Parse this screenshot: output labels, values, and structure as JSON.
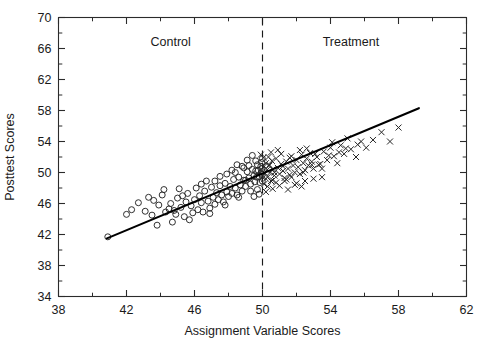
{
  "chart_data": {
    "type": "scatter",
    "title": "",
    "xlabel": "Assignment Variable Scores",
    "ylabel": "Posttest Scores",
    "xlim": [
      38,
      62
    ],
    "ylim": [
      34,
      70
    ],
    "xticks": [
      38,
      42,
      46,
      50,
      54,
      58,
      62
    ],
    "yticks": [
      34,
      38,
      42,
      46,
      50,
      54,
      58,
      62,
      66,
      70
    ],
    "xtick_labels": [
      "38",
      "42",
      "46",
      "50",
      "54",
      "58",
      "62"
    ],
    "ytick_labels": [
      "34",
      "38",
      "42",
      "46",
      "50",
      "54",
      "58",
      "62",
      "66",
      "70"
    ],
    "x_minor_step": 2,
    "y_minor_step": 2,
    "grid": false,
    "legend": "none",
    "annotations": [
      {
        "text": "Control",
        "x": 44.6,
        "y": 66.3
      },
      {
        "text": "Treatment",
        "x": 55.2,
        "y": 66.3
      }
    ],
    "cutoff": {
      "x": 50,
      "style": "dashed",
      "label": ""
    },
    "fit_line": {
      "x0": 40.85,
      "y0": 41.5,
      "x1": 59.2,
      "y1": 58.3,
      "slope": 0.9155,
      "intercept": 4.09
    },
    "series": [
      {
        "name": "Control",
        "marker": "circle",
        "marker_size": 4.0,
        "color": "#262626",
        "points": [
          [
            40.9,
            41.7
          ],
          [
            42.0,
            44.6
          ],
          [
            42.3,
            45.2
          ],
          [
            42.7,
            46.1
          ],
          [
            43.1,
            45.0
          ],
          [
            43.5,
            44.5
          ],
          [
            43.6,
            46.4
          ],
          [
            43.9,
            45.8
          ],
          [
            44.1,
            47.1
          ],
          [
            44.3,
            44.9
          ],
          [
            44.5,
            45.3
          ],
          [
            44.6,
            46.0
          ],
          [
            44.8,
            45.1
          ],
          [
            44.9,
            44.6
          ],
          [
            45.0,
            46.7
          ],
          [
            45.2,
            45.5
          ],
          [
            45.4,
            44.3
          ],
          [
            45.5,
            46.2
          ],
          [
            45.6,
            47.3
          ],
          [
            45.8,
            45.7
          ],
          [
            45.9,
            44.8
          ],
          [
            46.0,
            46.5
          ],
          [
            46.2,
            45.2
          ],
          [
            46.3,
            47.0
          ],
          [
            46.4,
            46.1
          ],
          [
            46.5,
            44.9
          ],
          [
            46.6,
            47.6
          ],
          [
            46.8,
            46.3
          ],
          [
            46.9,
            45.4
          ],
          [
            47.0,
            48.1
          ],
          [
            47.1,
            46.8
          ],
          [
            47.2,
            45.9
          ],
          [
            47.3,
            47.4
          ],
          [
            47.4,
            46.5
          ],
          [
            47.5,
            48.3
          ],
          [
            47.6,
            47.1
          ],
          [
            47.7,
            46.2
          ],
          [
            47.8,
            48.6
          ],
          [
            47.9,
            47.5
          ],
          [
            48.0,
            46.9
          ],
          [
            48.1,
            48.2
          ],
          [
            48.2,
            47.3
          ],
          [
            48.3,
            49.1
          ],
          [
            48.4,
            48.0
          ],
          [
            48.5,
            47.1
          ],
          [
            48.6,
            49.4
          ],
          [
            48.7,
            48.4
          ],
          [
            48.8,
            47.6
          ],
          [
            48.9,
            49.0
          ],
          [
            49.0,
            48.2
          ],
          [
            49.1,
            50.1
          ],
          [
            49.2,
            49.3
          ],
          [
            49.3,
            48.5
          ],
          [
            49.4,
            50.4
          ],
          [
            49.5,
            49.6
          ],
          [
            49.55,
            48.8
          ],
          [
            49.6,
            50.2
          ],
          [
            49.65,
            49.4
          ],
          [
            49.7,
            51.0
          ],
          [
            49.75,
            50.3
          ],
          [
            49.8,
            49.5
          ],
          [
            49.85,
            48.7
          ],
          [
            49.9,
            50.8
          ],
          [
            49.92,
            49.9
          ],
          [
            49.95,
            51.3
          ],
          [
            49.97,
            50.5
          ],
          [
            49.98,
            49.7
          ],
          [
            49.99,
            48.9
          ],
          [
            49.99,
            51.8
          ],
          [
            49.99,
            50.1
          ],
          [
            48.2,
            50.3
          ],
          [
            48.5,
            51.0
          ],
          [
            47.9,
            49.8
          ],
          [
            49.1,
            51.6
          ],
          [
            49.4,
            52.2
          ],
          [
            48.8,
            50.8
          ],
          [
            46.7,
            48.9
          ],
          [
            47.5,
            49.5
          ],
          [
            44.2,
            47.8
          ],
          [
            43.3,
            46.8
          ],
          [
            45.1,
            47.9
          ],
          [
            46.1,
            48.0
          ],
          [
            47.2,
            48.9
          ],
          [
            48.9,
            50.6
          ],
          [
            49.3,
            47.6
          ],
          [
            48.6,
            46.8
          ],
          [
            47.8,
            45.8
          ],
          [
            46.9,
            44.7
          ],
          [
            45.7,
            43.9
          ],
          [
            44.7,
            43.6
          ],
          [
            43.8,
            43.2
          ],
          [
            49.5,
            46.9
          ],
          [
            49.7,
            47.8
          ],
          [
            49.8,
            47.2
          ],
          [
            48.4,
            50.0
          ],
          [
            49.0,
            49.0
          ],
          [
            46.4,
            48.5
          ],
          [
            45.3,
            47.0
          ],
          [
            49.2,
            50.9
          ],
          [
            49.6,
            51.5
          ]
        ]
      },
      {
        "name": "Treatment",
        "marker": "cross",
        "marker_size": 4.2,
        "color": "#262626",
        "points": [
          [
            50.05,
            51.9
          ],
          [
            50.1,
            50.8
          ],
          [
            50.15,
            49.9
          ],
          [
            50.2,
            51.2
          ],
          [
            50.25,
            50.3
          ],
          [
            50.3,
            49.4
          ],
          [
            50.35,
            52.0
          ],
          [
            50.4,
            50.9
          ],
          [
            50.45,
            50.0
          ],
          [
            50.5,
            48.9
          ],
          [
            50.55,
            51.5
          ],
          [
            50.6,
            50.4
          ],
          [
            50.7,
            49.6
          ],
          [
            50.8,
            51.8
          ],
          [
            50.9,
            50.6
          ],
          [
            51.0,
            49.8
          ],
          [
            51.1,
            51.1
          ],
          [
            51.2,
            50.2
          ],
          [
            51.3,
            48.9
          ],
          [
            51.4,
            51.4
          ],
          [
            51.5,
            50.5
          ],
          [
            51.6,
            49.7
          ],
          [
            51.7,
            52.1
          ],
          [
            51.8,
            50.9
          ],
          [
            51.9,
            50.0
          ],
          [
            52.0,
            51.6
          ],
          [
            52.1,
            50.7
          ],
          [
            52.2,
            49.8
          ],
          [
            52.3,
            52.3
          ],
          [
            52.4,
            51.2
          ],
          [
            52.5,
            50.3
          ],
          [
            52.6,
            51.8
          ],
          [
            52.7,
            50.9
          ],
          [
            52.8,
            52.5
          ],
          [
            52.9,
            51.4
          ],
          [
            53.0,
            50.5
          ],
          [
            53.2,
            52.0
          ],
          [
            53.4,
            51.1
          ],
          [
            53.6,
            52.7
          ],
          [
            53.8,
            51.6
          ],
          [
            54.0,
            53.2
          ],
          [
            54.2,
            52.1
          ],
          [
            54.4,
            51.2
          ],
          [
            54.6,
            53.5
          ],
          [
            54.8,
            52.4
          ],
          [
            55.0,
            54.4
          ],
          [
            55.2,
            53.0
          ],
          [
            55.5,
            52.0
          ],
          [
            55.8,
            54.0
          ],
          [
            56.1,
            53.2
          ],
          [
            56.5,
            54.2
          ],
          [
            57.0,
            55.2
          ],
          [
            57.5,
            54.0
          ],
          [
            58.0,
            55.8
          ],
          [
            50.3,
            48.2
          ],
          [
            50.6,
            47.9
          ],
          [
            51.0,
            48.3
          ],
          [
            51.5,
            47.8
          ],
          [
            52.0,
            48.6
          ],
          [
            52.5,
            48.9
          ],
          [
            53.0,
            49.2
          ],
          [
            53.5,
            49.4
          ],
          [
            50.2,
            47.5
          ],
          [
            50.8,
            48.7
          ],
          [
            51.3,
            49.3
          ],
          [
            51.9,
            48.4
          ],
          [
            52.3,
            48.2
          ],
          [
            49.9,
            52.3
          ],
          [
            50.1,
            48.5
          ],
          [
            50.5,
            52.6
          ],
          [
            51.1,
            52.4
          ],
          [
            51.6,
            51.9
          ],
          [
            52.2,
            52.9
          ],
          [
            52.6,
            53.1
          ],
          [
            53.1,
            52.4
          ],
          [
            53.3,
            51.0
          ],
          [
            54.1,
            53.9
          ],
          [
            54.5,
            52.6
          ],
          [
            53.9,
            52.2
          ],
          [
            50.9,
            52.9
          ],
          [
            52.4,
            50.0
          ],
          [
            52.9,
            51.0
          ],
          [
            53.5,
            50.5
          ],
          [
            54.9,
            53.1
          ],
          [
            55.6,
            53.6
          ],
          [
            50.4,
            51.0
          ],
          [
            50.7,
            50.0
          ],
          [
            51.2,
            50.8
          ],
          [
            51.4,
            49.1
          ],
          [
            50.2,
            49.2
          ],
          [
            50.6,
            49.0
          ],
          [
            51.7,
            49.4
          ]
        ]
      }
    ]
  },
  "axes": {
    "frame_color": "#2b2b2b",
    "background": "#ffffff"
  }
}
